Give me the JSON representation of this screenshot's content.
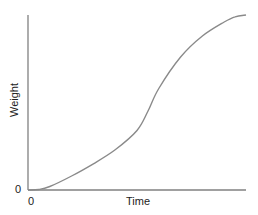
{
  "chart_data": {
    "type": "line",
    "title": "",
    "xlabel": "Time",
    "ylabel": "Weight",
    "x_tick_labels": [
      "0"
    ],
    "y_tick_labels": [
      "0"
    ],
    "grid": false,
    "legend": null,
    "series": [
      {
        "name": "growth",
        "shape": "sigmoid",
        "x": [
          0,
          0.05,
          0.1,
          0.2,
          0.3,
          0.4,
          0.5,
          0.55,
          0.6,
          0.7,
          0.8,
          0.9,
          0.95,
          1.0
        ],
        "values": [
          0,
          0.003,
          0.02,
          0.08,
          0.15,
          0.23,
          0.34,
          0.45,
          0.58,
          0.76,
          0.88,
          0.96,
          0.99,
          1.0
        ]
      }
    ],
    "color": "#8a8a8a"
  },
  "labels": {
    "x_axis": "Time",
    "y_axis": "Weight",
    "x_origin": "0",
    "y_origin": "0"
  }
}
